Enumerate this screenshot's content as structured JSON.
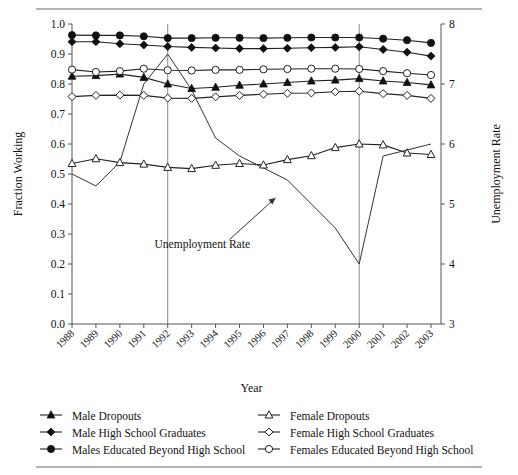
{
  "chart_data": {
    "type": "line",
    "title": "",
    "xlabel": "Year",
    "ylabel": "Fraction Working",
    "y2label": "Unemployment Rate",
    "ylim": [
      0.0,
      1.0
    ],
    "y2lim": [
      3,
      8
    ],
    "grid": false,
    "legend_position": "bottom",
    "x": [
      1988,
      1989,
      1990,
      1991,
      1992,
      1993,
      1994,
      1995,
      1996,
      1997,
      1998,
      1999,
      2000,
      2001,
      2002,
      2003
    ],
    "categories": [
      "1988",
      "1989",
      "1990",
      "1991",
      "1992",
      "1993",
      "1994",
      "1995",
      "1996",
      "1997",
      "1998",
      "1999",
      "2000",
      "2001",
      "2002",
      "2003"
    ],
    "ytick_labels": [
      "0.0",
      "0.1",
      "0.2",
      "0.3",
      "0.4",
      "0.5",
      "0.6",
      "0.7",
      "0.8",
      "0.9",
      "1.0"
    ],
    "ytick_values": [
      0.0,
      0.1,
      0.2,
      0.3,
      0.4,
      0.5,
      0.6,
      0.7,
      0.8,
      0.9,
      1.0
    ],
    "y2tick_labels": [
      "3",
      "4",
      "5",
      "6",
      "7",
      "8"
    ],
    "y2tick_values": [
      3,
      4,
      5,
      6,
      7,
      8
    ],
    "reference_lines": [
      1992,
      2000
    ],
    "annotations": [
      {
        "text": "Unemployment Rate",
        "x": 1995.0,
        "y": 0.255,
        "arrow_to_x": 1996.5,
        "arrow_to_y": 0.42
      }
    ],
    "series": [
      {
        "name": "Male Dropouts",
        "marker": "filled-triangle",
        "axis": "left",
        "values": [
          0.826,
          0.828,
          0.833,
          0.822,
          0.8,
          0.785,
          0.789,
          0.796,
          0.8,
          0.805,
          0.81,
          0.813,
          0.818,
          0.81,
          0.805,
          0.797
        ]
      },
      {
        "name": "Male High School Graduates",
        "marker": "filled-diamond",
        "axis": "left",
        "values": [
          0.941,
          0.941,
          0.934,
          0.93,
          0.925,
          0.922,
          0.92,
          0.918,
          0.918,
          0.919,
          0.921,
          0.922,
          0.924,
          0.915,
          0.906,
          0.893
        ]
      },
      {
        "name": "Males Educated Beyond High School",
        "marker": "filled-circle",
        "axis": "left",
        "values": [
          0.963,
          0.962,
          0.962,
          0.959,
          0.953,
          0.953,
          0.954,
          0.954,
          0.953,
          0.954,
          0.955,
          0.955,
          0.955,
          0.951,
          0.946,
          0.937
        ]
      },
      {
        "name": "Female Dropouts",
        "marker": "open-triangle",
        "axis": "left",
        "values": [
          0.535,
          0.551,
          0.538,
          0.533,
          0.522,
          0.518,
          0.529,
          0.535,
          0.53,
          0.548,
          0.561,
          0.588,
          0.6,
          0.597,
          0.57,
          0.565
        ]
      },
      {
        "name": "Female High School Graduates",
        "marker": "open-diamond",
        "axis": "left",
        "values": [
          0.758,
          0.762,
          0.763,
          0.762,
          0.753,
          0.752,
          0.757,
          0.762,
          0.766,
          0.769,
          0.77,
          0.774,
          0.776,
          0.768,
          0.762,
          0.752
        ]
      },
      {
        "name": "Females Educated Beyond High School",
        "marker": "open-circle",
        "axis": "left",
        "values": [
          0.848,
          0.84,
          0.843,
          0.851,
          0.846,
          0.845,
          0.847,
          0.847,
          0.849,
          0.85,
          0.851,
          0.851,
          0.85,
          0.843,
          0.836,
          0.83
        ]
      },
      {
        "name": "Unemployment Rate",
        "marker": "none",
        "axis": "right",
        "values": [
          5.5,
          5.3,
          5.7,
          7.0,
          7.5,
          6.9,
          6.1,
          5.8,
          5.6,
          5.4,
          5.0,
          4.6,
          4.0,
          5.8,
          5.9,
          6.0
        ]
      }
    ]
  },
  "legend": {
    "left_column": [
      {
        "label": "Male Dropouts",
        "marker": "filled-triangle"
      },
      {
        "label": "Male High School Graduates",
        "marker": "filled-diamond"
      },
      {
        "label": "Males Educated Beyond High School",
        "marker": "filled-circle"
      }
    ],
    "right_column": [
      {
        "label": "Female Dropouts",
        "marker": "open-triangle"
      },
      {
        "label": "Female High School Graduates",
        "marker": "open-diamond"
      },
      {
        "label": "Females Educated Beyond High School",
        "marker": "open-circle"
      }
    ]
  }
}
